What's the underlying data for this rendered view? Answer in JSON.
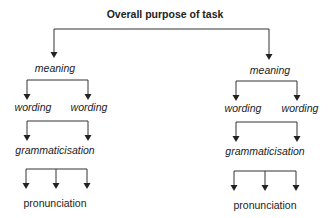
{
  "diagram": {
    "title": "Overall purpose of task",
    "colors": {
      "line": "#333333",
      "text": "#222222",
      "background": "#ffffff"
    },
    "branches": [
      {
        "meaning": "meaning",
        "wording": [
          "wording",
          "wording"
        ],
        "grammaticisation": "grammaticisation",
        "pronunciation": "pronunciation"
      },
      {
        "meaning": "meaning",
        "wording": [
          "wording",
          "wording"
        ],
        "grammaticisation": "grammaticisation",
        "pronunciation": "pronunciation"
      }
    ]
  }
}
